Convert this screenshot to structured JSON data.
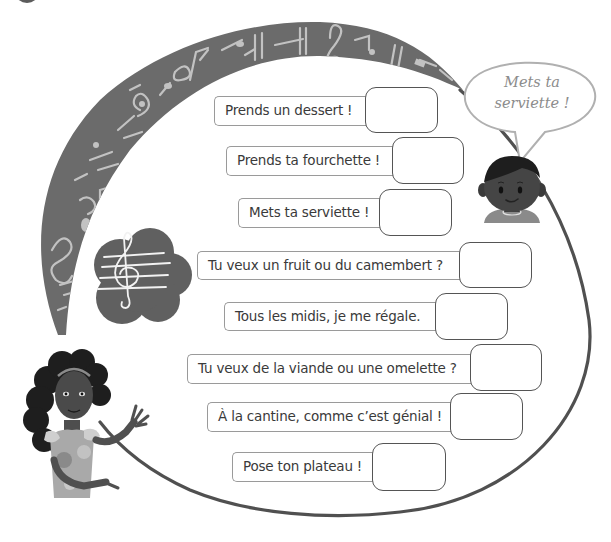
{
  "worksheet": {
    "exercise_marker": "dark-circle-badge",
    "colors": {
      "arc_fill": "#6b6b6b",
      "arc_notes": "#bdbdbd",
      "outline": "#555555",
      "label_border": "#9a9a9a",
      "answer_border": "#555555",
      "text": "#3a3a3a",
      "bubble_border": "#b0b0b0",
      "bubble_text": "#8c8c8c"
    },
    "speech_bubble": {
      "line1": "Mets ta",
      "line2": "serviette !"
    },
    "icons": {
      "music_arc": "music-notes-band",
      "cloud": "treble-clef-staff",
      "boy": "boy-character",
      "girl": "girl-character"
    },
    "rows": [
      {
        "label": "Prends un dessert !",
        "answer": ""
      },
      {
        "label": "Prends ta fourchette !",
        "answer": ""
      },
      {
        "label": "Mets ta serviette !",
        "answer": ""
      },
      {
        "label": "Tu veux un fruit ou du camembert ?",
        "answer": ""
      },
      {
        "label": "Tous les midis, je me régale.",
        "answer": ""
      },
      {
        "label": "Tu veux de la viande ou une omelette ?",
        "answer": ""
      },
      {
        "label": "À la cantine, comme c’est génial !",
        "answer": ""
      },
      {
        "label": "Pose ton plateau !",
        "answer": ""
      }
    ]
  }
}
